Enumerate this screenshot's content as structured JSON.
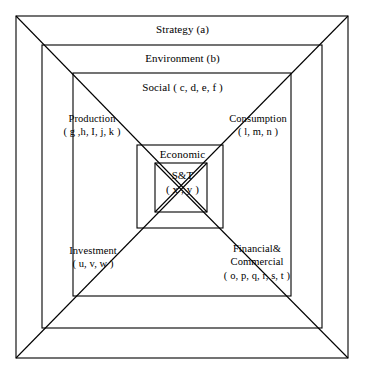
{
  "diagram": {
    "type": "nested-squares",
    "stroke_color": "#000000",
    "background_color": "#ffffff",
    "layers": [
      {
        "id": "strategy",
        "label": "Strategy (a)",
        "items": "a",
        "rect": {
          "x": 16,
          "y": 16,
          "w": 332,
          "h": 342
        }
      },
      {
        "id": "environment",
        "label": "Environment (b)",
        "items": "b",
        "rect": {
          "x": 42,
          "y": 45,
          "w": 280,
          "h": 283
        }
      },
      {
        "id": "social",
        "label": "Social ( c, d, e, f )",
        "items": "c, d, e, f",
        "rect": {
          "x": 73,
          "y": 73,
          "w": 218,
          "h": 223
        }
      },
      {
        "id": "economic",
        "label": "Economic",
        "items": "",
        "rect": {
          "x": 137,
          "y": 145,
          "w": 86,
          "h": 83
        }
      },
      {
        "id": "st",
        "label": "S&T",
        "items": "x , y",
        "rect": {
          "x": 155,
          "y": 163,
          "w": 52,
          "h": 49
        }
      }
    ],
    "st_items_label": "( x , y )",
    "corner_labels": [
      {
        "id": "production",
        "line1": "Production",
        "line2": "( g ,h, I, j, k )"
      },
      {
        "id": "consumption",
        "line1": "Consumption",
        "line2": "( l, m, n )"
      },
      {
        "id": "investment",
        "line1": "Investment",
        "line2": "( u, v, w )"
      },
      {
        "id": "financial",
        "line1": "Financial&",
        "line2": "Commercial",
        "line3": "( o, p, q, r, s, t )"
      }
    ]
  }
}
